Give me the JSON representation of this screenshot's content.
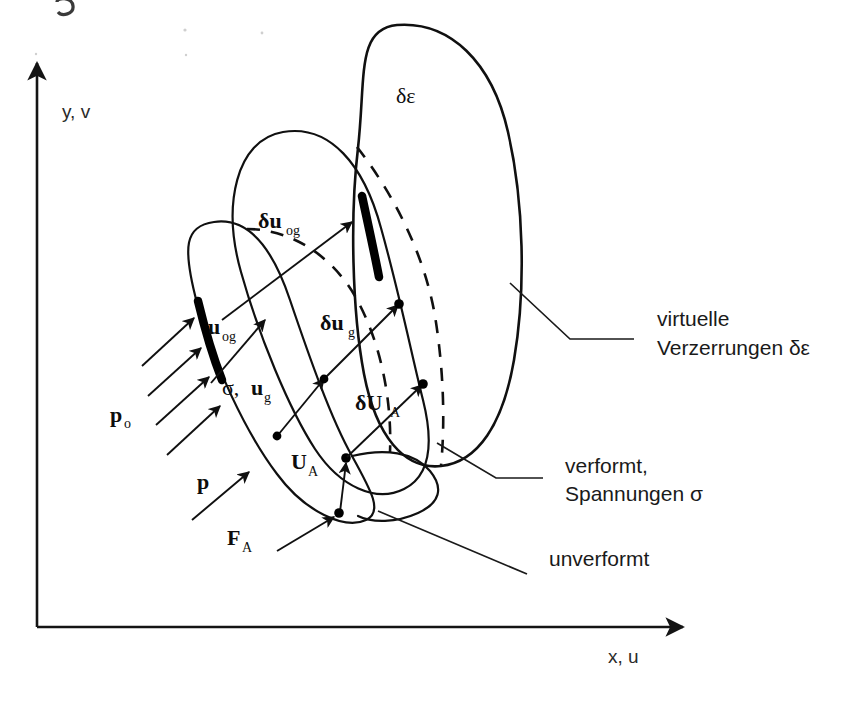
{
  "figure": {
    "kind": "mechanics-schematic",
    "background_color": "#ffffff",
    "line_color": "#101010"
  },
  "axes": {
    "y_label": "y, v",
    "x_label": "x, u"
  },
  "labels": {
    "delta_epsilon": "δε",
    "delta_u_og_main": "δu",
    "delta_u_og_sub": "og",
    "delta_u_g_main": "δu",
    "delta_u_g_sub": "g",
    "delta_U_A_main": "δU",
    "delta_U_A_sub": "A",
    "u_og_main": "u",
    "u_og_sub": "og",
    "sigma_u_g_prefix": "σ, ",
    "sigma_u_g_main": "u",
    "sigma_u_g_sub": "g",
    "U_A_main": "U",
    "U_A_sub": "A",
    "F_A_main": "F",
    "F_A_sub": "A",
    "p_o_main": "p",
    "p_o_sub": "o",
    "p_main": "p"
  },
  "legend": {
    "virtual_line1": "virtuelle",
    "virtual_line2": "Verzerrungen δε",
    "deformed_line1": "verformt,",
    "deformed_line2": "Spannungen σ",
    "undeformed": "unverformt"
  }
}
